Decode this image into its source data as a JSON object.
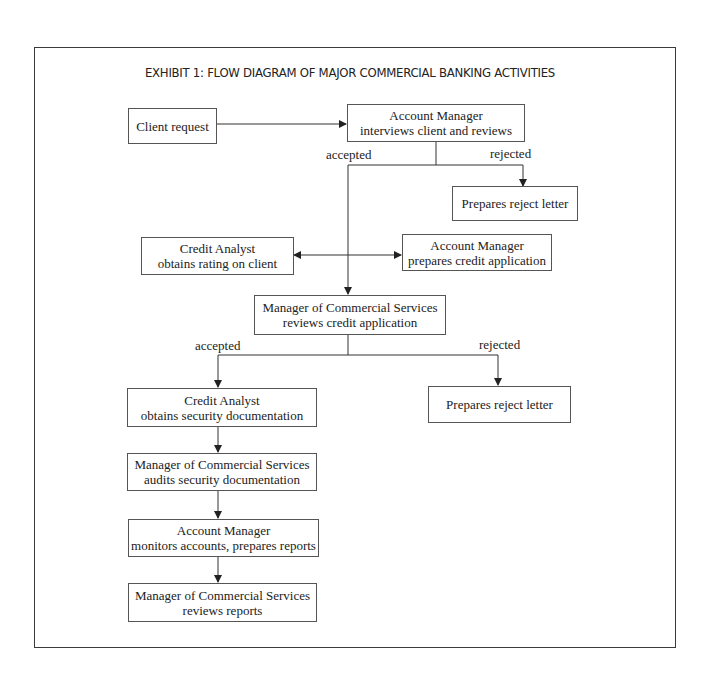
{
  "title": "EXHIBIT 1: FLOW DIAGRAM OF MAJOR COMMERCIAL BANKING ACTIVITIES",
  "nodes": {
    "client_request": {
      "line1": "Client request"
    },
    "am_interviews": {
      "line1": "Account Manager",
      "line2": "interviews client and reviews"
    },
    "reject_letter_1": {
      "line1": "Prepares reject letter"
    },
    "ca_rating": {
      "line1": "Credit Analyst",
      "line2": "obtains rating on client"
    },
    "am_prepares": {
      "line1": "Account Manager",
      "line2": "prepares credit application"
    },
    "mcs_reviews_app": {
      "line1": "Manager of Commercial Services",
      "line2": "reviews credit application"
    },
    "ca_security": {
      "line1": "Credit Analyst",
      "line2": "obtains security documentation"
    },
    "reject_letter_2": {
      "line1": "Prepares reject letter"
    },
    "mcs_audits": {
      "line1": "Manager of Commercial Services",
      "line2": "audits security documentation"
    },
    "am_monitors": {
      "line1": "Account Manager",
      "line2": "monitors accounts, prepares reports"
    },
    "mcs_reviews_reports": {
      "line1": "Manager of Commercial Services",
      "line2": "reviews reports"
    }
  },
  "labels": {
    "accepted_1": "accepted",
    "rejected_1": "rejected",
    "accepted_2": "accepted",
    "rejected_2": "rejected"
  },
  "edges": [
    {
      "from": "client_request",
      "to": "am_interviews"
    },
    {
      "from": "am_interviews",
      "to": "reject_letter_1",
      "label": "rejected"
    },
    {
      "from": "am_interviews",
      "to": "mcs_reviews_app",
      "label": "accepted"
    },
    {
      "from": "ca_rating",
      "to": "am_prepares",
      "bidirectional": true
    },
    {
      "from": "mcs_reviews_app",
      "to": "ca_security",
      "label": "accepted"
    },
    {
      "from": "mcs_reviews_app",
      "to": "reject_letter_2",
      "label": "rejected"
    },
    {
      "from": "ca_security",
      "to": "mcs_audits"
    },
    {
      "from": "mcs_audits",
      "to": "am_monitors"
    },
    {
      "from": "am_monitors",
      "to": "mcs_reviews_reports"
    }
  ],
  "colors": {
    "line": "#333333",
    "border": "#555555",
    "text": "#222222",
    "background": "#ffffff"
  }
}
